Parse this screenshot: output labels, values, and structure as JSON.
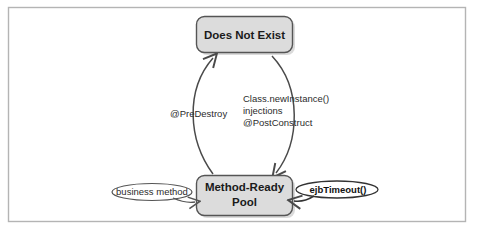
{
  "figure": {
    "frame": {
      "border_color": "#b4b4b4",
      "background": "#ffffff"
    },
    "states": [
      {
        "id": "does-not-exist",
        "label": "Does Not Exist",
        "fill": "#dcdcdc",
        "stroke": "#555555"
      },
      {
        "id": "method-ready-pool",
        "label_line1": "Method-Ready",
        "label_line2": "Pool",
        "fill": "#dcdcdc",
        "stroke": "#555555"
      }
    ],
    "transitions": [
      {
        "id": "destroy",
        "label": "@PreDestroy",
        "from": "method-ready-pool",
        "to": "does-not-exist"
      },
      {
        "id": "create",
        "label_line1": "Class.newInstance()",
        "label_line2": "injections",
        "label_line3": "@PostConstruct",
        "from": "does-not-exist",
        "to": "method-ready-pool"
      }
    ],
    "invocations": [
      {
        "id": "business-method",
        "label": "business method",
        "bold": false,
        "stroke": "#555555"
      },
      {
        "id": "ejb-timeout",
        "label": "ejbTimeout()",
        "bold": true,
        "stroke": "#333333"
      }
    ]
  }
}
